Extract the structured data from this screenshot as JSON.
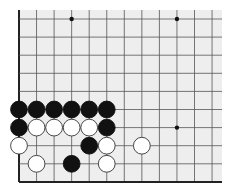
{
  "board": {
    "description": "Go board corner diagram (lower-left corner)",
    "columns": 12,
    "rows": 10,
    "edges": [
      "left",
      "bottom"
    ],
    "colors": {
      "background": "#eeeeee",
      "line": "#555555",
      "edge": "#222222",
      "black_stone": "#111111",
      "white_stone": "#ffffff",
      "star": "#111111"
    },
    "star_points": [
      {
        "col": 3,
        "row": 0
      },
      {
        "col": 9,
        "row": 0
      },
      {
        "col": 9,
        "row": 6
      }
    ],
    "stones": [
      {
        "col": 0,
        "row": 5,
        "color": "black"
      },
      {
        "col": 1,
        "row": 5,
        "color": "black"
      },
      {
        "col": 2,
        "row": 5,
        "color": "black"
      },
      {
        "col": 3,
        "row": 5,
        "color": "black"
      },
      {
        "col": 4,
        "row": 5,
        "color": "black"
      },
      {
        "col": 5,
        "row": 5,
        "color": "black"
      },
      {
        "col": 0,
        "row": 6,
        "color": "black"
      },
      {
        "col": 1,
        "row": 6,
        "color": "white"
      },
      {
        "col": 2,
        "row": 6,
        "color": "white"
      },
      {
        "col": 3,
        "row": 6,
        "color": "white"
      },
      {
        "col": 4,
        "row": 6,
        "color": "white"
      },
      {
        "col": 5,
        "row": 6,
        "color": "black"
      },
      {
        "col": 0,
        "row": 7,
        "color": "white"
      },
      {
        "col": 4,
        "row": 7,
        "color": "black"
      },
      {
        "col": 5,
        "row": 7,
        "color": "white"
      },
      {
        "col": 7,
        "row": 7,
        "color": "white"
      },
      {
        "col": 1,
        "row": 8,
        "color": "white"
      },
      {
        "col": 3,
        "row": 8,
        "color": "black"
      },
      {
        "col": 5,
        "row": 8,
        "color": "white"
      }
    ]
  }
}
